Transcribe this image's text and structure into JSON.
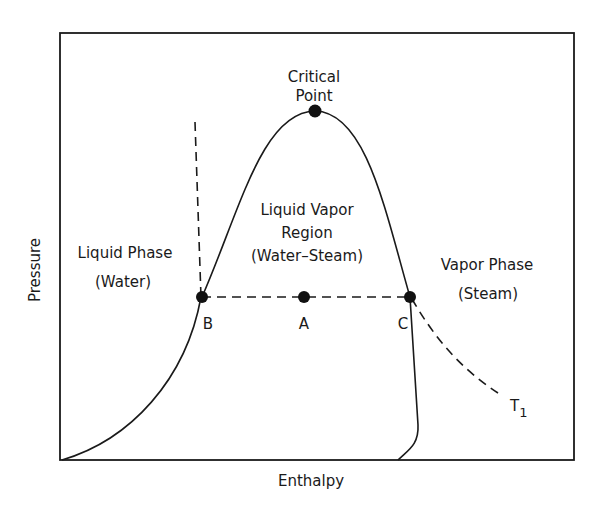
{
  "diagram": {
    "title_critical_line1": "Critical",
    "title_critical_line2": "Point",
    "region_label_line1": "Liquid Vapor",
    "region_label_line2": "Region",
    "region_label_line3": "(Water–Steam)",
    "liquid_phase_line1": "Liquid Phase",
    "liquid_phase_line2": "(Water)",
    "vapor_phase_line1": "Vapor Phase",
    "vapor_phase_line2": "(Steam)",
    "point_labels": {
      "B": "B",
      "A": "A",
      "C": "C"
    },
    "isotherm_label": "T",
    "isotherm_subscript": "1",
    "x_axis_label": "Enthalpy",
    "y_axis_label": "Pressure",
    "colors": {
      "line": "#1a1a1a",
      "background": "#ffffff"
    }
  }
}
